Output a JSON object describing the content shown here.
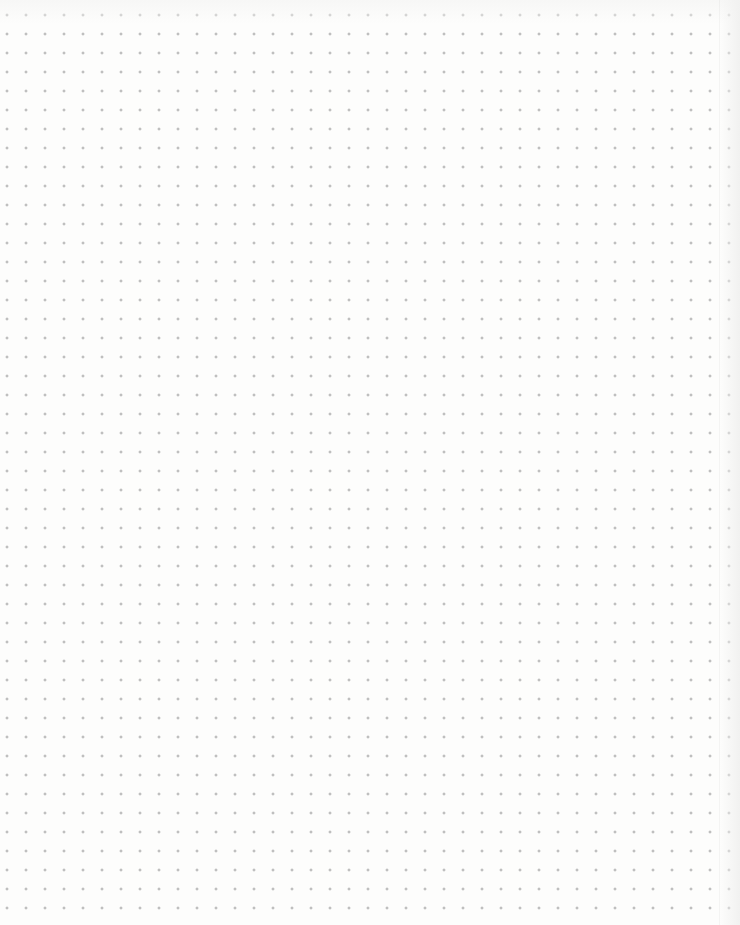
{
  "page": {
    "type": "dot-grid paper",
    "grid": {
      "columns": 38,
      "rows": 46,
      "spacing_px": 19,
      "first_dot": [
        26,
        34
      ],
      "dot_color": "#9a9a9a",
      "paper_color": "#fdfdfc"
    }
  }
}
